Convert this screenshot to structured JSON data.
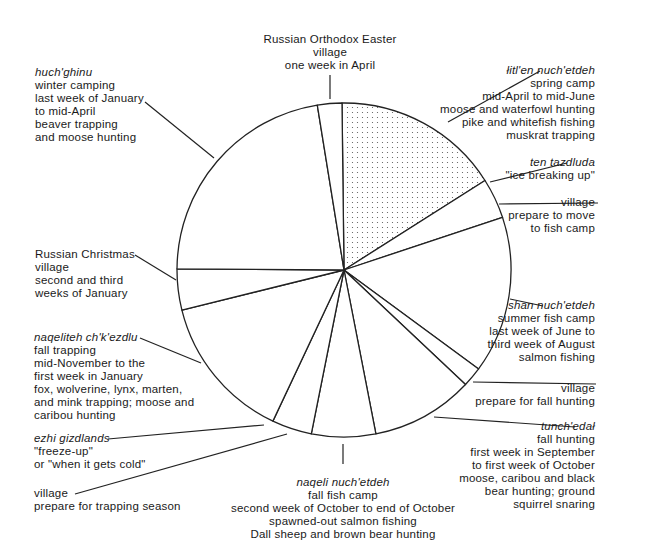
{
  "chart_data": {
    "type": "pie",
    "title": "",
    "center": [
      344,
      270
    ],
    "radius": 167,
    "start_angle_deg_clockwise_from_top": 0,
    "segments": [
      {
        "id": "spring-camp",
        "name": "łitl'en nuch'etdeh",
        "start": -0.7,
        "end": 57.6,
        "pattern": "dotted",
        "lines": [
          "spring camp",
          "mid-April to mid-June",
          "moose and waterfowl hunting",
          "pike and whitefish fishing",
          "muskrat trapping"
        ]
      },
      {
        "id": "village-prepare-fish-camp",
        "name": "",
        "start": 57.6,
        "end": 71.6,
        "pattern": "none",
        "lines": [
          "village",
          "prepare to move",
          "to fish camp"
        ]
      },
      {
        "id": "summer-fish-camp",
        "name": "shan nuch'etdeh",
        "start": 71.6,
        "end": 126.3,
        "pattern": "none",
        "lines": [
          "summer fish camp",
          "last week of June to",
          "third week of August",
          "salmon fishing"
        ]
      },
      {
        "id": "village-prepare-fall-hunting",
        "name": "",
        "start": 126.3,
        "end": 133.3,
        "pattern": "none",
        "lines": [
          "village",
          "prepare for fall hunting"
        ]
      },
      {
        "id": "fall-hunting",
        "name": "tunch'edał",
        "start": 133.3,
        "end": 169.0,
        "pattern": "none",
        "lines": [
          "fall hunting",
          "first week in September",
          "to first week of October",
          "moose, caribou and black",
          "bear hunting; ground",
          "squirrel snaring"
        ]
      },
      {
        "id": "fall-fish-camp",
        "name": "naqeli nuch'etdeh",
        "start": 169.0,
        "end": 191.3,
        "pattern": "none",
        "lines": [
          "fall fish camp",
          "second week of October to end of October",
          "spawned-out salmon fishing",
          "Dall sheep and brown bear hunting"
        ]
      },
      {
        "id": "village-prepare-trapping",
        "name": "",
        "start": 191.3,
        "end": 205.2,
        "pattern": "none",
        "lines": [
          "village",
          "prepare for trapping season"
        ]
      },
      {
        "id": "fall-trapping",
        "name": "naqeliteh ch'k'ezdlu",
        "start": 205.2,
        "end": 256.1,
        "pattern": "none",
        "lines": [
          "fall trapping",
          "mid-November to the",
          "first week in January",
          "fox, wolverine, lynx, marten,",
          "and mink trapping; moose and",
          "caribou hunting"
        ]
      },
      {
        "id": "russian-christmas",
        "name": "",
        "start": 256.1,
        "end": 270.4,
        "pattern": "none",
        "lines": [
          "Russian Christmas",
          "village",
          "second and third",
          "weeks of January"
        ]
      },
      {
        "id": "winter-camping",
        "name": "huch'ghinu",
        "start": 270.4,
        "end": 350.8,
        "pattern": "none",
        "lines": [
          "winter camping",
          "last week of January",
          "to mid-April",
          "beaver trapping",
          "and moose hunting"
        ]
      },
      {
        "id": "russian-orthodox-easter",
        "name": "",
        "start": 350.8,
        "end": 359.3,
        "pattern": "none",
        "lines": [
          "Russian Orthodox Easter",
          "village",
          "one week in April"
        ]
      }
    ],
    "point_events": [
      {
        "id": "ice-breaking-up",
        "name": "ten tazdluda",
        "lines": [
          "\"ice breaking up\""
        ],
        "at_angle": 57.6
      },
      {
        "id": "freeze-up",
        "name": "ezhi gizdlands",
        "lines": [
          "\"freeze-up\"",
          "or \"when it gets cold\""
        ],
        "at_angle": 205.2
      }
    ]
  },
  "labels": {
    "easter": {
      "l1": "Russian Orthodox Easter",
      "l2": "village",
      "l3": "one week in April"
    },
    "winter": {
      "name": "huch'ghinu",
      "l1": "winter camping",
      "l2": "last week of January",
      "l3": "to mid-April",
      "l4": "beaver trapping",
      "l5": "and moose hunting"
    },
    "spring": {
      "name": "łitl'en nuch'etdeh",
      "l1": "spring camp",
      "l2": "mid-April to mid-June",
      "l3": "moose and waterfowl hunting",
      "l4": "pike and whitefish fishing",
      "l5": "muskrat trapping"
    },
    "ice": {
      "name": "ten tazdluda",
      "l1": "\"ice breaking up\""
    },
    "village_fish": {
      "l1": "village",
      "l2": "prepare to move",
      "l3": "to fish camp"
    },
    "christmas": {
      "l1": "Russian Christmas",
      "l2": "village",
      "l3": "second and third",
      "l4": "weeks of January"
    },
    "summer": {
      "name": "shan nuch'etdeh",
      "l1": "summer fish camp",
      "l2": "last week of June to",
      "l3": "third week of August",
      "l4": "salmon fishing"
    },
    "fall_trap": {
      "name": "naqeliteh ch'k'ezdlu",
      "l1": "fall trapping",
      "l2": "mid-November to the",
      "l3": "first week in January",
      "l4": "fox, wolverine, lynx, marten,",
      "l5": "and mink trapping; moose and",
      "l6": "caribou hunting"
    },
    "village_hunt": {
      "l1": "village",
      "l2": "prepare for fall hunting"
    },
    "freeze": {
      "name": "ezhi gizdlands",
      "l1": "\"freeze-up\"",
      "l2": "or \"when it gets cold\""
    },
    "fall_hunt": {
      "name": "tunch'edał",
      "l1": "fall hunting",
      "l2": "first week in September",
      "l3": "to first week of October",
      "l4": "moose, caribou and black",
      "l5": "bear hunting; ground",
      "l6": "squirrel snaring"
    },
    "village_trap": {
      "l1": "village",
      "l2": "prepare for trapping season"
    },
    "fall_fish": {
      "name": "naqeli nuch'etdeh",
      "l1": "fall fish camp",
      "l2": "second week of October to end of October",
      "l3": "spawned-out salmon fishing",
      "l4": "Dall sheep and brown bear hunting"
    }
  },
  "colors": {
    "stroke": "#222222",
    "background": "#ffffff",
    "dots": "#555555"
  }
}
